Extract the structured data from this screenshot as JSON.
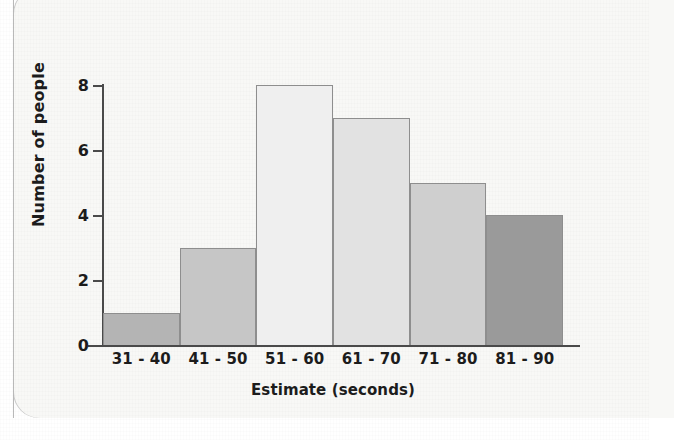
{
  "chart_data": {
    "type": "bar",
    "title": "",
    "xlabel": "Estimate (seconds)",
    "ylabel": "Number of people",
    "categories": [
      "31 - 40",
      "41 - 50",
      "51 - 60",
      "61 - 70",
      "71 - 80",
      "81 - 90"
    ],
    "values": [
      1,
      3,
      8,
      7,
      5,
      4
    ],
    "ylim": [
      0,
      8
    ],
    "yticks": [
      0,
      2,
      4,
      6,
      8
    ],
    "ytick_labels": [
      "0",
      "2",
      "4",
      "6",
      "8"
    ],
    "grid": false,
    "legend": null,
    "bar_colors": [
      "#b4b4b4",
      "#c6c6c6",
      "#efefef",
      "#e2e2e2",
      "#cfcfcf",
      "#9a9a9a"
    ],
    "axis_color": "#4a4a4a",
    "bar_border_color": "#8e8e8e",
    "background": "#f8f8f6"
  }
}
